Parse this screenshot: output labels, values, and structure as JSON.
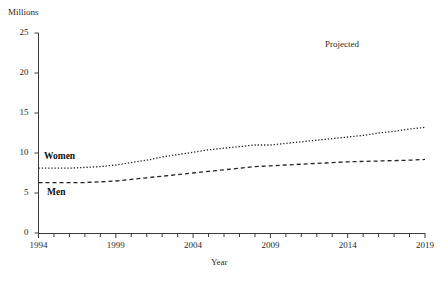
{
  "chart_data": {
    "type": "line",
    "title": "",
    "xlabel": "Year",
    "ylabel": "Millions",
    "xlim": [
      1994,
      2019
    ],
    "ylim": [
      0,
      25
    ],
    "ytick_values": [
      0,
      5,
      10,
      15,
      20,
      25
    ],
    "ytick_labels": [
      "0",
      "5",
      "10",
      "15",
      "20",
      "25"
    ],
    "xtick_values": [
      1994,
      1999,
      2004,
      2009,
      2014,
      2019
    ],
    "xtick_labels": [
      "1994",
      "1999",
      "2004",
      "2009",
      "2014",
      "2019"
    ],
    "minor_xticks_every": 1,
    "grid": false,
    "legend_position": "inline-labels",
    "x": [
      1994,
      1995,
      1996,
      1997,
      1998,
      1999,
      2000,
      2001,
      2002,
      2003,
      2004,
      2005,
      2006,
      2007,
      2008,
      2009,
      2010,
      2011,
      2012,
      2013,
      2014,
      2015,
      2016,
      2017,
      2018,
      2019
    ],
    "series": [
      {
        "name": "Women",
        "style": "dotted",
        "color": "#222222",
        "values": [
          8.1,
          8.1,
          8.1,
          8.2,
          8.3,
          8.5,
          8.8,
          9.1,
          9.5,
          9.8,
          10.1,
          10.4,
          10.6,
          10.8,
          11.0,
          11.0,
          11.2,
          11.4,
          11.6,
          11.8,
          12.0,
          12.2,
          12.5,
          12.7,
          13.0,
          13.2
        ]
      },
      {
        "name": "Men",
        "style": "dashed",
        "color": "#222222",
        "values": [
          6.3,
          6.3,
          6.3,
          6.3,
          6.4,
          6.5,
          6.7,
          6.9,
          7.1,
          7.3,
          7.5,
          7.7,
          7.9,
          8.1,
          8.3,
          8.4,
          8.5,
          8.6,
          8.7,
          8.8,
          8.9,
          8.95,
          9.0,
          9.05,
          9.1,
          9.2
        ]
      }
    ],
    "annotations": [
      {
        "text": "Projected",
        "x": 2016,
        "y": 22.5
      }
    ]
  },
  "labels": {
    "women": "Women",
    "men": "Men",
    "projected": "Projected",
    "y_axis_title": "Millions",
    "x_axis_title": "Year"
  }
}
